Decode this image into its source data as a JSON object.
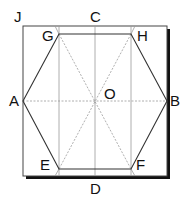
{
  "diagram": {
    "points": {
      "J": "J",
      "C": "C",
      "G": "G",
      "H": "H",
      "A": "A",
      "O": "O",
      "B": "B",
      "E": "E",
      "F": "F",
      "D": "D"
    },
    "colors": {
      "line": "#333333",
      "crease": "#999999",
      "shadow": "#111111"
    }
  }
}
